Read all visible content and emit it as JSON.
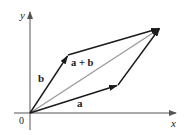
{
  "figure": {
    "type": "vector-addition-parallelogram",
    "colors": {
      "axis": "#555555",
      "vector": "#1a1a1a",
      "diagonal": "#9a9a9a",
      "text": "#222222"
    },
    "axes": {
      "x_label": "x",
      "y_label": "y",
      "origin_label": "0"
    },
    "vectors": [
      {
        "name": "a",
        "label": "a",
        "from": [
          30,
          113
        ],
        "to": [
          118,
          85
        ]
      },
      {
        "name": "b",
        "label": "b",
        "from": [
          30,
          113
        ],
        "to": [
          68,
          55
        ]
      },
      {
        "name": "a-plus-b",
        "label": "a + b",
        "from": [
          30,
          113
        ],
        "to": [
          160,
          28
        ]
      }
    ],
    "labels": {
      "a": "a",
      "b": "b",
      "sum": "a + b"
    }
  }
}
